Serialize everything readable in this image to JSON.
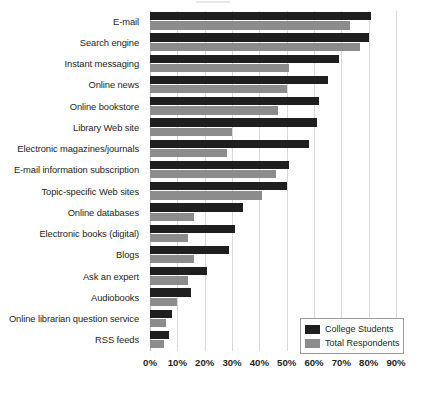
{
  "chart_data": {
    "type": "bar",
    "orientation": "horizontal",
    "title": "",
    "subtitle": "",
    "xlabel": "",
    "ylabel": "",
    "xlim": [
      0,
      90
    ],
    "xtick_labels": [
      "0%",
      "10%",
      "20%",
      "30%",
      "40%",
      "50%",
      "60%",
      "70%",
      "80%",
      "90%"
    ],
    "xtick_values": [
      0,
      10,
      20,
      30,
      40,
      50,
      60,
      70,
      80,
      90
    ],
    "grid": true,
    "grid_axis": "x",
    "legend_position": "bottom-right",
    "categories": [
      "E-mail",
      "Search engine",
      "Instant messaging",
      "Online news",
      "Online bookstore",
      "Library Web site",
      "Electronic magazines/journals",
      "E-mail information subscription",
      "Topic-specific Web sites",
      "Online databases",
      "Electronic books (digital)",
      "Blogs",
      "Ask an expert",
      "Audiobooks",
      "Online librarian question service",
      "RSS feeds"
    ],
    "series": [
      {
        "name": "College Students",
        "color": "#201f1f",
        "values": [
          81,
          80,
          69,
          65,
          62,
          61,
          58,
          51,
          50,
          34,
          31,
          29,
          21,
          15,
          8,
          7
        ]
      },
      {
        "name": "Total Respondents",
        "color": "#8c8c8c",
        "values": [
          73,
          77,
          51,
          50,
          47,
          30,
          28,
          46,
          41,
          16,
          14,
          16,
          14,
          10,
          6,
          5
        ]
      }
    ]
  },
  "legend": {
    "items": [
      {
        "label": "College Students",
        "color": "#201f1f"
      },
      {
        "label": "Total Respondents",
        "color": "#8c8c8c"
      }
    ]
  },
  "colors": {
    "dark_series": "#201f1f",
    "light_series": "#8c8c8c",
    "gridline": "#d9d9d9",
    "text": "#231f20",
    "background": "#ffffff"
  }
}
